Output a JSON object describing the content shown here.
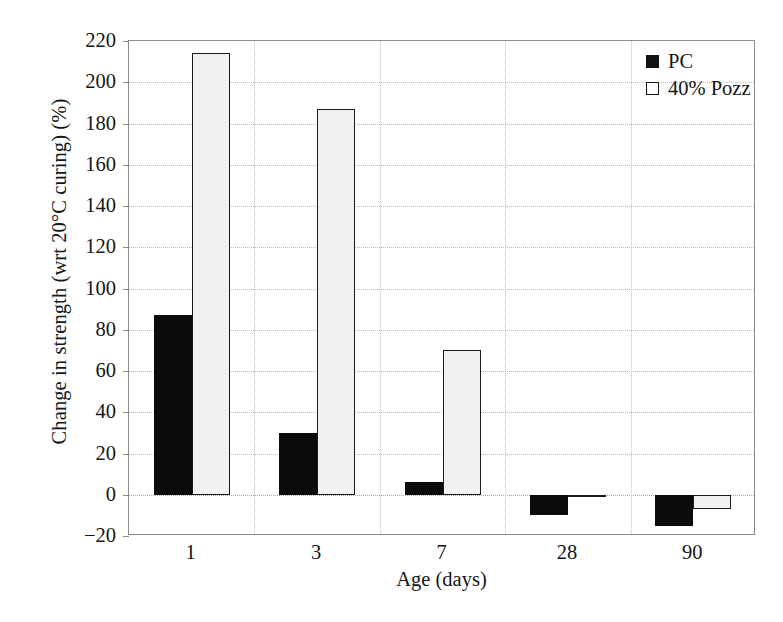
{
  "chart_data": {
    "type": "bar",
    "title": "",
    "xlabel": "Age (days)",
    "ylabel": "Change in strength (wrt 20°C curing) (%)",
    "categories": [
      "1",
      "3",
      "7",
      "28",
      "90"
    ],
    "series": [
      {
        "name": "PC",
        "values": [
          87,
          30,
          6,
          -10,
          -15
        ],
        "color": "#0b0b0b",
        "marker": "filled-square"
      },
      {
        "name": "40% Pozz",
        "values": [
          214,
          187,
          70,
          -1,
          -7
        ],
        "color": "#f1f1f1",
        "marker": "open-square"
      }
    ],
    "ylim": [
      -20,
      220
    ],
    "ytick_step": 20,
    "yticks": [
      220,
      200,
      180,
      160,
      140,
      120,
      100,
      80,
      60,
      40,
      20,
      0,
      -20
    ],
    "ytick_labels": [
      "220",
      "200",
      "180",
      "160",
      "140",
      "120",
      "100",
      "80",
      "60",
      "40",
      "20",
      "0",
      "−20"
    ],
    "grid": "horizontal-and-category-dividers",
    "legend_position": "top-right",
    "zero_line": 0
  },
  "legend": {
    "entries": [
      {
        "label": "PC"
      },
      {
        "label": "40% Pozz"
      }
    ]
  }
}
